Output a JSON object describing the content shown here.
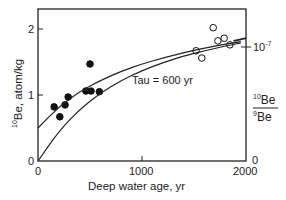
{
  "chart_data": {
    "type": "scatter",
    "title": "",
    "xlabel": "Deep water age, yr",
    "ylabel": "10Be, atom/kg",
    "ylabel_sup": "10",
    "ylabel_main": "Be, atom/kg",
    "y2label_top_sup": "10",
    "y2label_top": "Be",
    "y2label_bottom_sup": "9",
    "y2label_bottom": "Be",
    "xlim": [
      0,
      2000
    ],
    "ylim": [
      0,
      2.3
    ],
    "x_ticks": [
      "0",
      "1000",
      "2000"
    ],
    "y_ticks": [
      "0",
      "1",
      "2"
    ],
    "y2_ticks": [
      "0",
      "10-7"
    ],
    "y2_tick_top_base": "10",
    "y2_tick_top_exp": "-7",
    "y2_tick_bottom": "0",
    "annotation": "Tau = 600 yr",
    "grid": false,
    "series": [
      {
        "name": "filled circles",
        "marker": "filled",
        "points": [
          [
            155,
            0.82
          ],
          [
            210,
            0.67
          ],
          [
            260,
            0.85
          ],
          [
            290,
            0.97
          ],
          [
            460,
            1.06
          ],
          [
            500,
            1.47
          ],
          [
            510,
            1.06
          ],
          [
            590,
            1.05
          ]
        ]
      },
      {
        "name": "open circles",
        "marker": "open",
        "points": [
          [
            1520,
            1.67
          ],
          [
            1575,
            1.56
          ],
          [
            1685,
            2.02
          ],
          [
            1730,
            1.82
          ],
          [
            1790,
            1.86
          ],
          [
            1845,
            1.76
          ]
        ]
      },
      {
        "name": "upper model curve",
        "marker": "line",
        "points": [
          [
            0,
            0.5
          ],
          [
            200,
            0.82
          ],
          [
            400,
            1.05
          ],
          [
            600,
            1.22
          ],
          [
            800,
            1.36
          ],
          [
            1000,
            1.47
          ],
          [
            1200,
            1.56
          ],
          [
            1400,
            1.64
          ],
          [
            1600,
            1.71
          ],
          [
            1800,
            1.77
          ],
          [
            1950,
            1.81
          ]
        ]
      },
      {
        "name": "lower model curve",
        "marker": "line",
        "points": [
          [
            0,
            0.0
          ],
          [
            200,
            0.45
          ],
          [
            400,
            0.78
          ],
          [
            600,
            1.03
          ],
          [
            800,
            1.22
          ],
          [
            1000,
            1.37
          ],
          [
            1200,
            1.49
          ],
          [
            1400,
            1.59
          ],
          [
            1600,
            1.67
          ],
          [
            1800,
            1.74
          ],
          [
            1950,
            1.79
          ]
        ]
      },
      {
        "name": "right segment",
        "marker": "line",
        "points": [
          [
            1880,
            1.82
          ],
          [
            2000,
            1.86
          ]
        ]
      }
    ]
  }
}
